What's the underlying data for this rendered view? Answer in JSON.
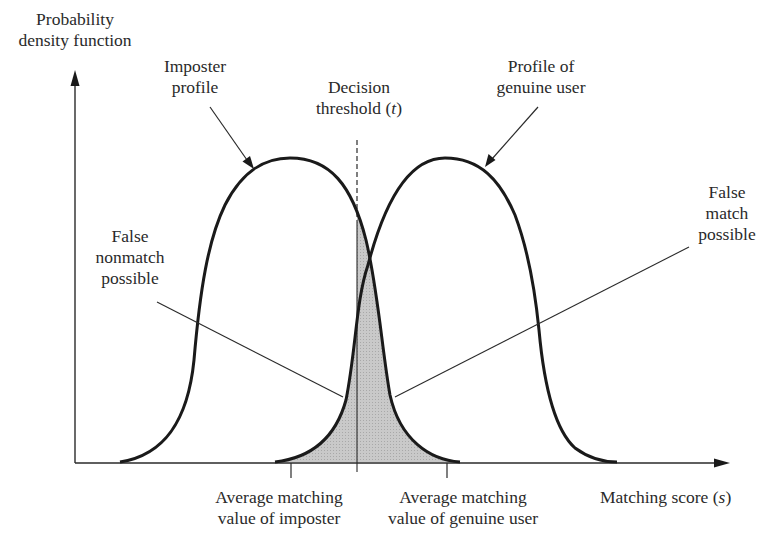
{
  "figure": {
    "y_axis_label_line1": "Probability",
    "y_axis_label_line2": "density function",
    "x_axis_label_text": "Matching score (",
    "x_axis_label_var": "s",
    "x_axis_label_close": ")",
    "imposter_label_line1": "Imposter",
    "imposter_label_line2": "profile",
    "threshold_label_line1": "Decision",
    "threshold_label_text": "threshold (",
    "threshold_label_var": "t",
    "threshold_label_close": ")",
    "genuine_label_line1": "Profile of",
    "genuine_label_line2": "genuine user",
    "false_nonmatch_line1": "False",
    "false_nonmatch_line2": "nonmatch",
    "false_nonmatch_line3": "possible",
    "false_match_line1": "False",
    "false_match_line2": "match",
    "false_match_line3": "possible",
    "avg_imposter_line1": "Average matching",
    "avg_imposter_line2": "value of imposter",
    "avg_genuine_line1": "Average matching",
    "avg_genuine_line2": "value of genuine user"
  },
  "colors": {
    "curve": "#1a1a1a",
    "axis": "#2a2a2a",
    "overlap_fill": "#c4c4c4",
    "text": "#2a2a2a"
  }
}
